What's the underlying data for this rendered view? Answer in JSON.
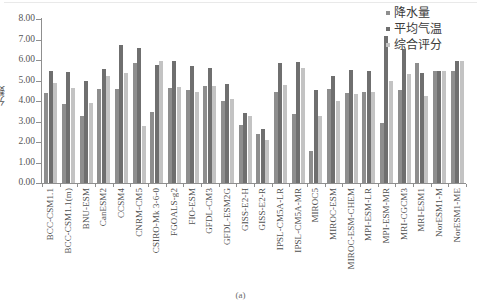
{
  "figure": {
    "caption": "(a)",
    "y_axis_title": "分数"
  },
  "legend": {
    "position": "top-right",
    "items": [
      {
        "label": "降水量",
        "color": "#8e8e8e"
      },
      {
        "label": "平均气温",
        "color": "#6f6f6f"
      },
      {
        "label": "综合评分",
        "color": "#c3c3c3"
      }
    ]
  },
  "chart_data": {
    "type": "bar",
    "title": "",
    "subtitle": "",
    "xlabel": "",
    "ylabel": "分数",
    "ylim": [
      0,
      8
    ],
    "ytick_labels": [
      "0.00",
      "1.00",
      "2.00",
      "3.00",
      "4.00",
      "5.00",
      "6.00",
      "7.00",
      "8.00"
    ],
    "ytick_values": [
      0,
      1,
      2,
      3,
      4,
      5,
      6,
      7,
      8
    ],
    "grid": false,
    "legend_position": "top-right",
    "categories": [
      "BCC-CSM1.1",
      "BCC-CSM1.1(m)",
      "BNU-ESM",
      "CanESM2",
      "CCSM4",
      "CNRM-CM5",
      "CSIRO-Mk 3-6-0",
      "FGOALS-g2",
      "FIO-ESM",
      "GFDL-CM3",
      "GFDL-ESM2G",
      "GISS-E2-H",
      "GISS-E2-R",
      "IPSL-CM5A-LR",
      "IPSL-CM5A-MR",
      "MIROC5",
      "MIROC-ESM",
      "MIROC-ESM-CHEM",
      "MPI-ESM-LR",
      "MPI-ESM-MR",
      "MRI-CGCM3",
      "MRI-ESM1",
      "NorESM1-M",
      "NorESM1-ME"
    ],
    "series": [
      {
        "name": "降水量",
        "color": "#8e8e8e",
        "values": [
          4.4,
          3.85,
          3.25,
          4.6,
          4.6,
          5.85,
          3.45,
          4.65,
          4.55,
          4.75,
          4.0,
          2.85,
          2.4,
          4.45,
          3.35,
          1.55,
          4.6,
          4.4,
          4.45,
          2.95,
          4.55,
          5.85,
          5.45,
          5.45
        ]
      },
      {
        "name": "平均气温",
        "color": "#6f6f6f",
        "values": [
          5.45,
          5.4,
          5.0,
          5.55,
          6.75,
          6.6,
          5.75,
          5.95,
          5.7,
          5.6,
          4.85,
          3.4,
          2.65,
          5.85,
          5.9,
          4.55,
          5.2,
          5.5,
          5.45,
          7.15,
          6.55,
          5.35,
          5.45,
          5.95
        ]
      },
      {
        "name": "综合评分",
        "color": "#c3c3c3",
        "values": [
          4.9,
          4.65,
          3.9,
          5.2,
          5.35,
          2.8,
          5.95,
          4.7,
          4.45,
          4.75,
          4.1,
          3.25,
          2.1,
          4.8,
          5.6,
          3.25,
          4.0,
          4.35,
          4.45,
          5.0,
          5.3,
          4.25,
          5.45,
          5.95
        ]
      }
    ]
  }
}
